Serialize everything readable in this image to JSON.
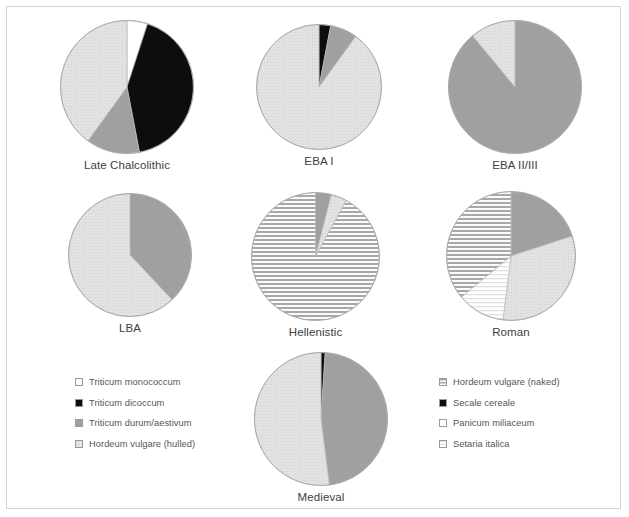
{
  "figure": {
    "kind": "pie-chart-panel",
    "background_color": "#ffffff",
    "border_color": "#d2d2d2"
  },
  "palette": {
    "white": "#ffffff",
    "black": "#0d0d0d",
    "mid_gray": "#a0a0a0",
    "light_gray_dotted": "#dcdcdc",
    "gray_striped": "#b4b4b4",
    "pale_striped": "#f2f2f2",
    "outline": "#9a9a9a"
  },
  "legend_left": {
    "name": "crop-legend-left",
    "items": [
      {
        "label": "Triticum monococcum",
        "swatch": "white",
        "pattern": "solid"
      },
      {
        "label": "Triticum dicoccum",
        "swatch": "black",
        "pattern": "solid"
      },
      {
        "label": "Triticum durum/aestivum",
        "swatch": "mid_gray",
        "pattern": "solid"
      },
      {
        "label": "Hordeum vulgare (hulled)",
        "swatch": "light_gray_dotted",
        "pattern": "dots"
      }
    ]
  },
  "legend_right": {
    "name": "crop-legend-right",
    "items": [
      {
        "label": "Hordeum vulgare (naked)",
        "swatch": "gray_striped",
        "pattern": "hlines"
      },
      {
        "label": "Secale cereale",
        "swatch": "black",
        "pattern": "solid"
      },
      {
        "label": "Panicum miliaceum",
        "swatch": "white",
        "pattern": "solid"
      },
      {
        "label": "Setaria italica",
        "swatch": "pale_striped",
        "pattern": "hlines-faint"
      }
    ]
  },
  "chart_data": [
    {
      "type": "pie",
      "title": "Late Chalcolithic",
      "labels": [
        "Triticum monococcum",
        "Triticum dicoccum",
        "Triticum durum/aestivum",
        "Hordeum vulgare (hulled)"
      ],
      "values": [
        5,
        42,
        13,
        40
      ],
      "fills": [
        "white",
        "black",
        "mid_gray",
        "light_gray_dotted"
      ],
      "start_angle": 0
    },
    {
      "type": "pie",
      "title": "EBA I",
      "labels": [
        "Triticum dicoccum",
        "Triticum durum/aestivum",
        "Hordeum vulgare (hulled)"
      ],
      "values": [
        3,
        7,
        90
      ],
      "fills": [
        "black",
        "mid_gray",
        "light_gray_dotted"
      ],
      "start_angle": 0
    },
    {
      "type": "pie",
      "title": "EBA II/III",
      "labels": [
        "Triticum durum/aestivum",
        "Hordeum vulgare (hulled)"
      ],
      "values": [
        89,
        11
      ],
      "fills": [
        "mid_gray",
        "light_gray_dotted"
      ],
      "start_angle": 0
    },
    {
      "type": "pie",
      "title": "LBA",
      "labels": [
        "Triticum durum/aestivum",
        "Hordeum vulgare (hulled)"
      ],
      "values": [
        38,
        62
      ],
      "fills": [
        "mid_gray",
        "light_gray_dotted"
      ],
      "start_angle": 0
    },
    {
      "type": "pie",
      "title": "Hellenistic",
      "labels": [
        "Triticum durum/aestivum",
        "Hordeum vulgare (hulled)",
        "Hordeum vulgare (naked)"
      ],
      "values": [
        4,
        4,
        92
      ],
      "fills": [
        "mid_gray",
        "light_gray_dotted",
        "gray_striped"
      ],
      "start_angle": 0
    },
    {
      "type": "pie",
      "title": "Roman",
      "labels": [
        "Triticum durum/aestivum",
        "Hordeum vulgare (hulled)",
        "Setaria italica",
        "Hordeum vulgare (naked)"
      ],
      "values": [
        20,
        32,
        12,
        36
      ],
      "fills": [
        "mid_gray",
        "light_gray_dotted",
        "pale_striped",
        "gray_striped"
      ],
      "start_angle": 0
    },
    {
      "type": "pie",
      "title": "Medieval",
      "labels": [
        "Secale cereale",
        "Triticum durum/aestivum",
        "Hordeum vulgare (hulled)"
      ],
      "values": [
        1,
        47,
        52
      ],
      "fills": [
        "black",
        "mid_gray",
        "light_gray_dotted"
      ],
      "start_angle": 0
    }
  ]
}
